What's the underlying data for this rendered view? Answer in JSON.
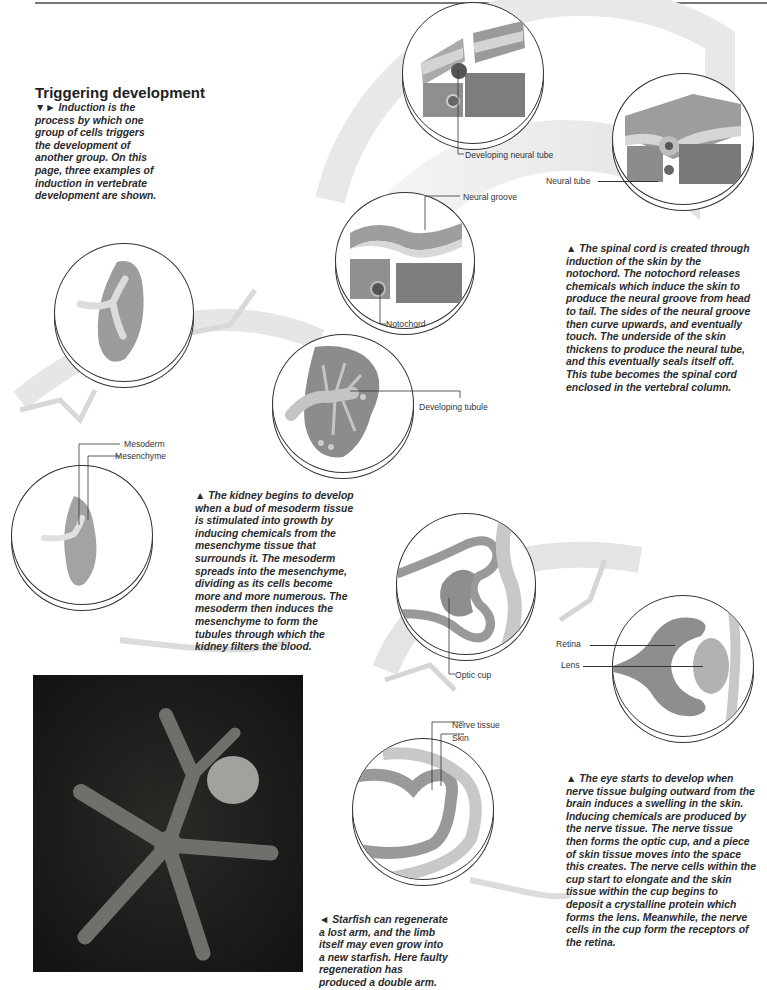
{
  "page": {
    "section_title": "Triggering development",
    "intro_caption": {
      "markers": "▼►",
      "text": "Induction is the process by which one group of cells triggers the development of another group. On this page, three examples of induction in vertebrate development are shown."
    }
  },
  "spinal_cord": {
    "caption_marker": "▲",
    "caption": "The spinal cord is created through induction of the skin by the notochord. The notochord releases chemicals which induce the skin to produce the neural groove from head to tail. The sides of the neural groove then curve upwards, and eventually touch. The underside of the skin thickens to produce the neural tube, and this eventually seals itself off. This tube becomes the spinal cord enclosed in the vertebral column.",
    "labels": {
      "neural_groove": "Neural groove",
      "notochord": "Notochord",
      "developing_neural_tube": "Developing neural tube",
      "neural_tube": "Neural tube"
    }
  },
  "kidney": {
    "caption_marker": "▲",
    "caption": "The kidney begins to develop when a bud of mesoderm tissue is stimulated into growth by inducing chemicals from the mesenchyme tissue that surrounds it. The mesoderm spreads into the mesenchyme, dividing as its cells become more and more numerous. The mesoderm then induces the mesenchyme to form the tubules through which the kidney filters the blood.",
    "labels": {
      "mesoderm": "Mesoderm",
      "mesenchyme": "Mesenchyme",
      "developing_tubule": "Developing tubule"
    }
  },
  "eye": {
    "caption_marker": "▲",
    "caption": "The eye starts to develop when nerve tissue bulging outward from the brain induces a swelling in the skin. Inducing chemicals are produced by the nerve tissue. The nerve tissue then forms the optic cup, and a piece of skin tissue moves into the space this creates. The nerve cells within the cup start to elongate and the skin tissue within the cup begins to deposit a crystalline protein which forms the lens. Meanwhile, the nerve cells in the cup form the receptors of the retina.",
    "labels": {
      "nerve_tissue": "Nerve tissue",
      "skin": "Skin",
      "optic_cup": "Optic cup",
      "retina": "Retina",
      "lens": "Lens"
    }
  },
  "starfish": {
    "caption_marker": "◄",
    "caption": "Starfish can regenerate a lost arm, and the limb itself may even grow into a new starfish. Here faulty regeneration has produced a double arm."
  },
  "colors": {
    "text": "#222222",
    "tissue_gray": "#8a8a8a",
    "band_gray": "#e4e4e4",
    "photo_bg": "#1e1e1c",
    "starfish": "#6f6f6c"
  }
}
